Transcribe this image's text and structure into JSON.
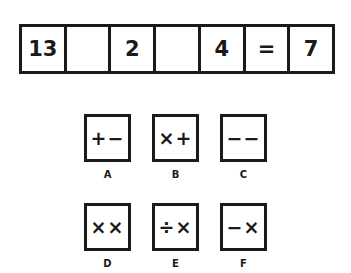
{
  "equation": {
    "cells": [
      "13",
      "",
      "2",
      "",
      "4",
      "=",
      "7"
    ]
  },
  "options": [
    {
      "label": "A",
      "symbols": "+−"
    },
    {
      "label": "B",
      "symbols": "×+"
    },
    {
      "label": "C",
      "symbols": "−−"
    },
    {
      "label": "D",
      "symbols": "××"
    },
    {
      "label": "E",
      "symbols": "÷×"
    },
    {
      "label": "F",
      "symbols": "−×"
    }
  ]
}
